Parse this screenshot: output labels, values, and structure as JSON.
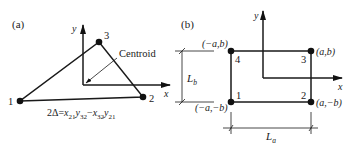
{
  "panel_a": {
    "label": "(a)",
    "axis_y": "y",
    "axis_x": "x",
    "nodes": [
      {
        "id": "1",
        "label": "1"
      },
      {
        "id": "2",
        "label": "2"
      },
      {
        "id": "3",
        "label": "3"
      }
    ],
    "centroid_label": "Centroid",
    "formula": {
      "lhs": "2Δ=",
      "t1_var": "x",
      "t1_sub": "21",
      "t2_var": "y",
      "t2_sub": "32",
      "minus": "−",
      "t3_var": "x",
      "t3_sub": "32",
      "t4_var": "y",
      "t4_sub": "21"
    }
  },
  "panel_b": {
    "label": "(b)",
    "axis_y": "y",
    "axis_x": "x",
    "nodes": [
      {
        "id": "1",
        "label": "1",
        "coord": "(−a,−b)"
      },
      {
        "id": "2",
        "label": "2",
        "coord": "(a,−b)"
      },
      {
        "id": "3",
        "label": "3",
        "coord": "(a,b)"
      },
      {
        "id": "4",
        "label": "4",
        "coord": "(−a,b)"
      }
    ],
    "dim_vertical": {
      "var": "L",
      "sub": "b"
    },
    "dim_horizontal": {
      "var": "L",
      "sub": "a"
    }
  },
  "colors": {
    "ink": "#1a1a1a",
    "background": "#ffffff"
  }
}
